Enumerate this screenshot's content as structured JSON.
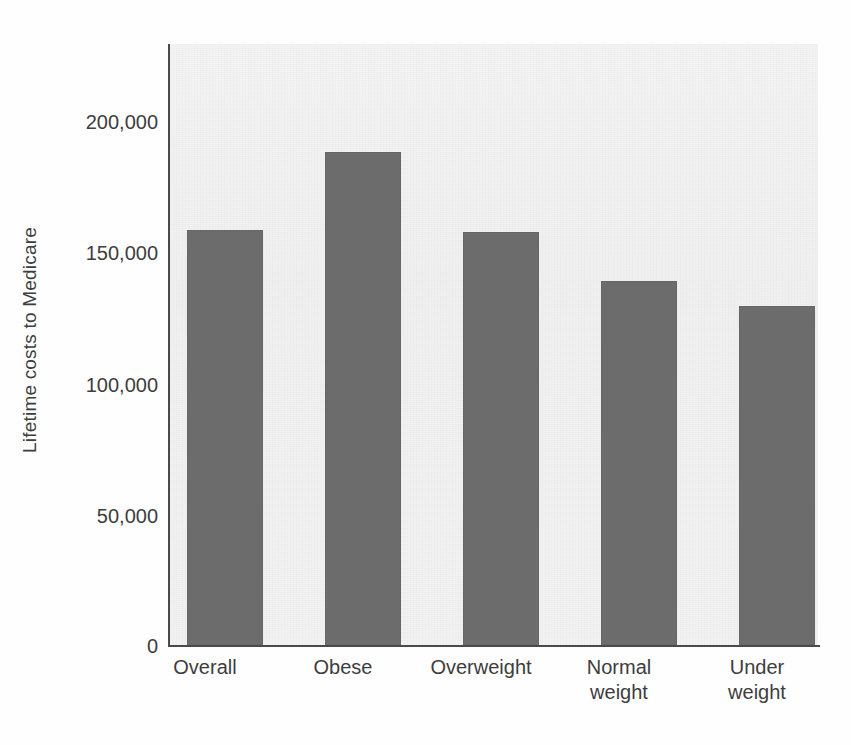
{
  "chart_data": {
    "type": "bar",
    "title": "",
    "xlabel": "",
    "ylabel": "Lifetime costs to Medicare",
    "categories": [
      "Overall",
      "Obese",
      "Overweight",
      "Normal\nweight",
      "Under\nweight"
    ],
    "category_labels_flat": [
      "Overall",
      "Obese",
      "Overweight",
      "Normal weight",
      "Under weight"
    ],
    "values": [
      157500,
      187000,
      156500,
      138000,
      128500
    ],
    "series": [
      {
        "name": "Lifetime costs to Medicare",
        "values": [
          157500,
          187000,
          156500,
          138000,
          128500
        ]
      }
    ],
    "ylim": [
      0,
      228000
    ],
    "yticks": [
      0,
      50000,
      100000,
      150000,
      200000
    ],
    "ytick_labels": [
      "0",
      "50,000",
      "100,000",
      "150,000",
      "200,000"
    ],
    "grid": false,
    "legend": "none",
    "bar_color": "#6c6c6c",
    "plot_background": "#f1f1f1",
    "axis_color": "#4a4a4a",
    "text_color": "#3d3d3d"
  },
  "axis": {
    "y_title": "Lifetime costs to Medicare"
  }
}
